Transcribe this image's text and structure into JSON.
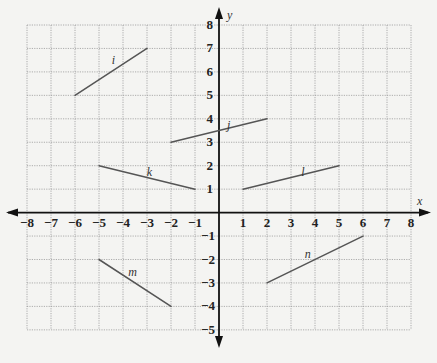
{
  "diagram": {
    "type": "coordinate-plane",
    "x_axis": {
      "label": "x",
      "min": -8,
      "max": 8,
      "ticks": [
        "−8",
        "−7",
        "−6",
        "−5",
        "−4",
        "−3",
        "−2",
        "−1",
        "1",
        "2",
        "3",
        "4",
        "5",
        "6",
        "7",
        "8"
      ]
    },
    "y_axis": {
      "label": "y",
      "min": -5,
      "max": 8,
      "ticks_positive": [
        "1",
        "2",
        "3",
        "4",
        "5",
        "6",
        "7",
        "8"
      ],
      "ticks_negative": [
        "−1",
        "−2",
        "−3",
        "−4",
        "−5"
      ]
    },
    "grid": true,
    "segments": [
      {
        "name": "i",
        "from": [
          -6,
          5
        ],
        "to": [
          -3,
          7
        ],
        "label_at": [
          -4.4,
          6.5
        ]
      },
      {
        "name": "j",
        "from": [
          -2,
          3
        ],
        "to": [
          2,
          4
        ],
        "label_at": [
          0.4,
          3.75
        ]
      },
      {
        "name": "k",
        "from": [
          -5,
          2
        ],
        "to": [
          -1,
          1
        ],
        "label_at": [
          -2.9,
          1.75
        ]
      },
      {
        "name": "l",
        "from": [
          1,
          1
        ],
        "to": [
          5,
          2
        ],
        "label_at": [
          3.5,
          1.75
        ]
      },
      {
        "name": "m",
        "from": [
          -5,
          -2
        ],
        "to": [
          -2,
          -4
        ],
        "label_at": [
          -3.6,
          -2.55
        ]
      },
      {
        "name": "n",
        "from": [
          2,
          -3
        ],
        "to": [
          6,
          -1
        ],
        "label_at": [
          3.7,
          -1.75
        ]
      }
    ]
  }
}
